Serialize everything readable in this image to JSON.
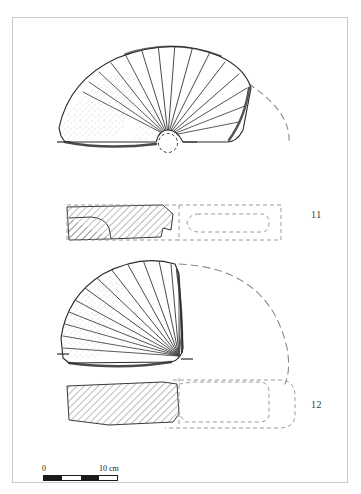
{
  "plate": {
    "top_caption": "",
    "figure_labels": [
      {
        "id": "11",
        "text": "11"
      },
      {
        "id": "12",
        "text": "12"
      }
    ],
    "scale": {
      "start_label": "0",
      "end_label": "10 cm",
      "unit": "cm",
      "length_value": 10,
      "segments": 4
    },
    "objects": [
      {
        "label": "11",
        "description": "fan-shaped scallop-shell artefact, plan view with dashed reconstruction arc",
        "views": [
          "plan",
          "section"
        ],
        "features": [
          "radial-ribs",
          "circular-perforation-notch",
          "axis-tick-marks"
        ]
      },
      {
        "label": "12",
        "description": "fan-shaped scallop-shell artefact, plan view with dashed reconstruction arc",
        "views": [
          "plan",
          "section"
        ],
        "features": [
          "radial-ribs",
          "axis-tick-marks"
        ]
      }
    ]
  },
  "colors": {
    "ink": "#1a1a1a",
    "frame": "#c9c9c9",
    "hatch": "#555555",
    "dashed": "#8a8a8a",
    "stipple": "#6b6b6b"
  }
}
